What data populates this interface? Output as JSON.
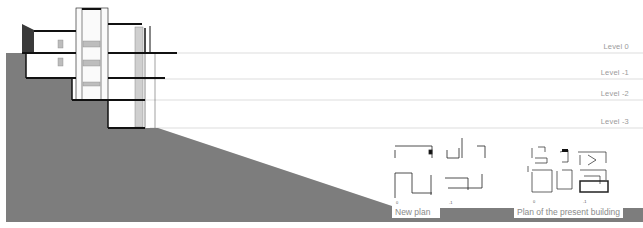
{
  "figure": {
    "type": "architectural-section",
    "colors": {
      "terrain": "#7d7d7d",
      "level_line": "#d4d4d4",
      "label": "#9a9a9a",
      "structure": "#111111"
    }
  },
  "levels": [
    {
      "label": "Level  0",
      "y": 53
    },
    {
      "label": "Level -1",
      "y": 79
    },
    {
      "label": "Level -2",
      "y": 100
    },
    {
      "label": "Level -3",
      "y": 128
    }
  ],
  "plans": [
    {
      "caption": "New plan",
      "markers": [
        "0",
        "-1"
      ]
    },
    {
      "caption": "Plan of the present building",
      "markers": [
        "0",
        "-1"
      ]
    }
  ]
}
